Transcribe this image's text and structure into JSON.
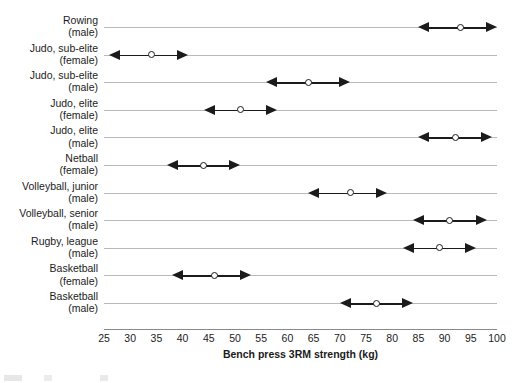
{
  "chart_data": {
    "type": "range-dot",
    "title": "",
    "xlabel": "Bench press 3RM strength (kg)",
    "ylabel": "",
    "xlim": [
      25,
      100
    ],
    "xticks": [
      25,
      30,
      35,
      40,
      45,
      50,
      55,
      60,
      65,
      70,
      75,
      80,
      85,
      90,
      95,
      100
    ],
    "grid": false,
    "legend": null,
    "categories": [
      "Rowing (male)",
      "Judo, sub-elite (female)",
      "Judo, sub-elite (male)",
      "Judo, elite (female)",
      "Judo, elite (male)",
      "Netball (female)",
      "Volleyball, junior (male)",
      "Volleyball, senior (male)",
      "Rugby, league (male)",
      "Basketball (female)",
      "Basketball (male)"
    ],
    "rows": [
      {
        "label_line1": "Rowing",
        "label_line2": "(male)",
        "low": 85,
        "mid": 93,
        "high": 100
      },
      {
        "label_line1": "Judo, sub-elite",
        "label_line2": "(female)",
        "low": 26,
        "mid": 34,
        "high": 41
      },
      {
        "label_line1": "Judo, sub-elite",
        "label_line2": "(male)",
        "low": 56,
        "mid": 64,
        "high": 72
      },
      {
        "label_line1": "Judo, elite",
        "label_line2": "(female)",
        "low": 44,
        "mid": 51,
        "high": 58
      },
      {
        "label_line1": "Judo, elite",
        "label_line2": "(male)",
        "low": 85,
        "mid": 92,
        "high": 99
      },
      {
        "label_line1": "Netball",
        "label_line2": "(female)",
        "low": 37,
        "mid": 44,
        "high": 51
      },
      {
        "label_line1": "Volleyball, junior",
        "label_line2": "(male)",
        "low": 64,
        "mid": 72,
        "high": 79
      },
      {
        "label_line1": "Volleyball, senior",
        "label_line2": "(male)",
        "low": 84,
        "mid": 91,
        "high": 98
      },
      {
        "label_line1": "Rugby, league",
        "label_line2": "(male)",
        "low": 82,
        "mid": 89,
        "high": 96
      },
      {
        "label_line1": "Basketball",
        "label_line2": "(female)",
        "low": 38,
        "mid": 46,
        "high": 53
      },
      {
        "label_line1": "Basketball",
        "label_line2": "(male)",
        "low": 70,
        "mid": 77,
        "high": 84
      }
    ],
    "colors": {
      "marker_stroke": "#1b1b1b",
      "marker_fill": "#ffffff",
      "arrow": "#1b1b1b",
      "row_rule": "#b9b9b9",
      "axis": "#8a8a8a",
      "text": "#1b1b1b",
      "background": "#ffffff"
    }
  }
}
